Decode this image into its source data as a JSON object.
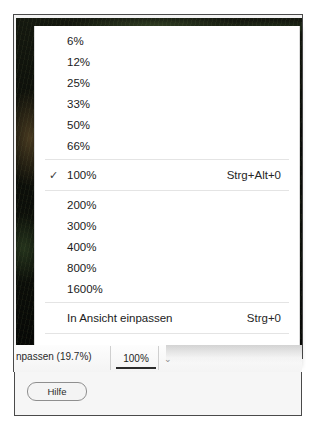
{
  "window": {
    "kind": "image-editor-dialog",
    "photo_alt": "dark-foliage-photo-preview"
  },
  "zoom_menu": {
    "name": "zoom-level-menu",
    "groups": [
      {
        "items": [
          {
            "label": "6%",
            "checked": false,
            "shortcut": ""
          },
          {
            "label": "12%",
            "checked": false,
            "shortcut": ""
          },
          {
            "label": "25%",
            "checked": false,
            "shortcut": ""
          },
          {
            "label": "33%",
            "checked": false,
            "shortcut": ""
          },
          {
            "label": "50%",
            "checked": false,
            "shortcut": ""
          },
          {
            "label": "66%",
            "checked": false,
            "shortcut": ""
          }
        ]
      },
      {
        "items": [
          {
            "label": "100%",
            "checked": true,
            "shortcut": "Strg+Alt+0",
            "check_glyph": "✓"
          }
        ]
      },
      {
        "items": [
          {
            "label": "200%",
            "checked": false,
            "shortcut": ""
          },
          {
            "label": "300%",
            "checked": false,
            "shortcut": ""
          },
          {
            "label": "400%",
            "checked": false,
            "shortcut": ""
          },
          {
            "label": "800%",
            "checked": false,
            "shortcut": ""
          },
          {
            "label": "1600%",
            "checked": false,
            "shortcut": ""
          }
        ]
      },
      {
        "items": [
          {
            "label": "In Ansicht einpassen",
            "checked": false,
            "shortcut": "Strg+0"
          }
        ]
      },
      {
        "items": [
          {
            "label": "Globale Zoomeinstellungen",
            "checked": false,
            "shortcut": ""
          }
        ]
      }
    ]
  },
  "statusbar": {
    "fit_label": "npassen (19.7%)",
    "active_zoom_tab": "100%",
    "caret_glyph": "⌄"
  },
  "footer": {
    "help_label": "Hilfe"
  },
  "colors": {
    "menu_background": "#ffffff",
    "menu_border": "#dcdcdc",
    "separator": "#e4e4e4",
    "text": "#1b1b1b",
    "active_tab_underline": "#2b2b2b",
    "window_border": "#4a4a4a"
  }
}
